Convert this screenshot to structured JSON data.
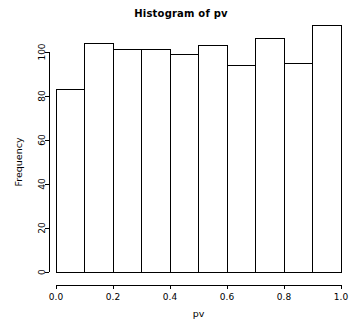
{
  "chart_data": {
    "type": "bar",
    "title": "Histogram of pv",
    "xlabel": "pv",
    "ylabel": "Frequency",
    "categories": [
      "0.0-0.1",
      "0.1-0.2",
      "0.2-0.3",
      "0.3-0.4",
      "0.4-0.5",
      "0.5-0.6",
      "0.6-0.7",
      "0.7-0.8",
      "0.8-0.9",
      "0.9-1.0"
    ],
    "bin_edges": [
      0.0,
      0.1,
      0.2,
      0.3,
      0.4,
      0.5,
      0.6,
      0.7,
      0.8,
      0.9,
      1.0
    ],
    "values": [
      83,
      104,
      101,
      101,
      99,
      103,
      94,
      106,
      95,
      112
    ],
    "xlim": [
      0.0,
      1.0
    ],
    "ylim": [
      0,
      112
    ],
    "x_ticks": [
      0.0,
      0.2,
      0.4,
      0.6,
      0.8,
      1.0
    ],
    "x_tick_labels": [
      "0.0",
      "0.2",
      "0.4",
      "0.6",
      "0.8",
      "1.0"
    ],
    "y_ticks": [
      0,
      20,
      40,
      60,
      80,
      100
    ],
    "y_tick_labels": [
      "0",
      "20",
      "40",
      "60",
      "80",
      "100"
    ],
    "grid": false,
    "legend": false,
    "bar_fill_color": "#ffffff",
    "bar_border_color": "#000000",
    "axis_color": "#000000"
  }
}
